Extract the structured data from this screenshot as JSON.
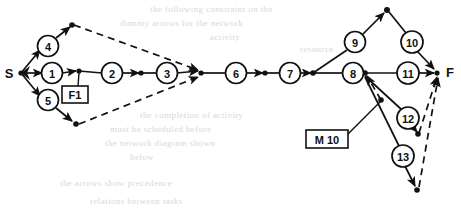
{
  "diagram": {
    "type": "activity-on-node network",
    "stroke_color": "#111111",
    "background_color": "#ffffff",
    "terminals": {
      "start": "S",
      "finish": "F"
    },
    "nodes": [
      {
        "id": "n1",
        "label": "1",
        "cx": 52,
        "cy": 73
      },
      {
        "id": "n2",
        "label": "2",
        "cx": 112,
        "cy": 73
      },
      {
        "id": "n3",
        "label": "3",
        "cx": 167,
        "cy": 73
      },
      {
        "id": "n4",
        "label": "4",
        "cx": 48,
        "cy": 46
      },
      {
        "id": "n5",
        "label": "5",
        "cx": 48,
        "cy": 100
      },
      {
        "id": "n6",
        "label": "6",
        "cx": 236,
        "cy": 73
      },
      {
        "id": "n7",
        "label": "7",
        "cx": 290,
        "cy": 73
      },
      {
        "id": "n8",
        "label": "8",
        "cx": 353,
        "cy": 73
      },
      {
        "id": "n9",
        "label": "9",
        "cx": 355,
        "cy": 42
      },
      {
        "id": "n10",
        "label": "10",
        "cx": 412,
        "cy": 42
      },
      {
        "id": "n11",
        "label": "11",
        "cx": 408,
        "cy": 73
      },
      {
        "id": "n12",
        "label": "12",
        "cx": 408,
        "cy": 118
      },
      {
        "id": "n13",
        "label": "13",
        "cx": 403,
        "cy": 156
      }
    ],
    "junction_points": [
      {
        "id": "j-start",
        "cx": 21,
        "cy": 73
      },
      {
        "id": "j-f1",
        "cx": 79,
        "cy": 70
      },
      {
        "id": "j-after2",
        "cx": 141,
        "cy": 73
      },
      {
        "id": "j-top",
        "cx": 72,
        "cy": 25
      },
      {
        "id": "j-bottom",
        "cx": 76,
        "cy": 124
      },
      {
        "id": "j-merge",
        "cx": 201,
        "cy": 73
      },
      {
        "id": "j-after6",
        "cx": 265,
        "cy": 73
      },
      {
        "id": "j-before8",
        "cx": 313,
        "cy": 73
      },
      {
        "id": "j-after8",
        "cx": 365,
        "cy": 73
      },
      {
        "id": "j-apex",
        "cx": 387,
        "cy": 10
      },
      {
        "id": "j-m10",
        "cx": 381,
        "cy": 100
      },
      {
        "id": "j-12end",
        "cx": 418,
        "cy": 134
      },
      {
        "id": "j-finish",
        "cx": 437,
        "cy": 73
      },
      {
        "id": "j-bot-end",
        "cx": 417,
        "cy": 190
      }
    ],
    "boxes": [
      {
        "id": "box-f1",
        "label": "F1",
        "x": 62,
        "y": 86,
        "w": 26,
        "h": 17
      },
      {
        "id": "box-m10",
        "label": "M 10",
        "x": 306,
        "y": 130,
        "w": 42,
        "h": 18
      }
    ],
    "edges": [
      {
        "from": "S",
        "to": "4",
        "style": "solid"
      },
      {
        "from": "S",
        "to": "1",
        "style": "solid"
      },
      {
        "from": "S",
        "to": "5",
        "style": "solid"
      },
      {
        "from": "4",
        "to": "j-top",
        "style": "solid"
      },
      {
        "from": "j-top",
        "to": "j-merge",
        "style": "dashed"
      },
      {
        "from": "1",
        "to": "j-f1",
        "style": "solid"
      },
      {
        "from": "j-f1",
        "to": "2",
        "style": "solid"
      },
      {
        "from": "2",
        "to": "j-after2",
        "style": "solid"
      },
      {
        "from": "j-after2",
        "to": "3",
        "style": "solid"
      },
      {
        "from": "3",
        "to": "j-merge",
        "style": "solid"
      },
      {
        "from": "5",
        "to": "j-bottom",
        "style": "solid"
      },
      {
        "from": "j-bottom",
        "to": "j-merge",
        "style": "dashed"
      },
      {
        "from": "j-merge",
        "to": "6",
        "style": "solid"
      },
      {
        "from": "6",
        "to": "j-after6",
        "style": "solid"
      },
      {
        "from": "j-after6",
        "to": "7",
        "style": "solid"
      },
      {
        "from": "7",
        "to": "j-before8",
        "style": "solid"
      },
      {
        "from": "j-before8",
        "to": "8",
        "style": "solid"
      },
      {
        "from": "j-before8",
        "to": "9",
        "style": "solid"
      },
      {
        "from": "9",
        "to": "j-apex",
        "style": "solid"
      },
      {
        "from": "j-apex",
        "to": "10",
        "style": "solid"
      },
      {
        "from": "10",
        "to": "F",
        "style": "solid"
      },
      {
        "from": "8",
        "to": "j-after8",
        "style": "solid"
      },
      {
        "from": "j-after8",
        "to": "11",
        "style": "solid"
      },
      {
        "from": "11",
        "to": "F",
        "style": "solid"
      },
      {
        "from": "j-after8",
        "to": "12",
        "style": "solid"
      },
      {
        "from": "12",
        "to": "j-12end",
        "style": "solid"
      },
      {
        "from": "j-12end",
        "to": "F",
        "style": "dashed"
      },
      {
        "from": "j-after8",
        "to": "13",
        "style": "solid"
      },
      {
        "from": "13",
        "to": "j-bot-end",
        "style": "solid"
      },
      {
        "from": "j-bot-end",
        "to": "F",
        "style": "dashed"
      },
      {
        "from": "j-m10",
        "to": "j-after8",
        "style": "dashed"
      },
      {
        "from": "box-m10",
        "to": "j-m10",
        "style": "leader"
      },
      {
        "from": "box-f1",
        "to": "j-f1",
        "style": "leader"
      }
    ]
  },
  "background_text": {
    "lines": [
      {
        "text": "the following constraint on the",
        "x": 150,
        "y": 4
      },
      {
        "text": "dummy arrows for the network",
        "x": 120,
        "y": 18
      },
      {
        "text": "activity",
        "x": 210,
        "y": 32
      },
      {
        "text": "resource",
        "x": 300,
        "y": 44
      },
      {
        "text": "the completion of activity",
        "x": 140,
        "y": 110
      },
      {
        "text": "must be scheduled before",
        "x": 110,
        "y": 124
      },
      {
        "text": "the network diagram shown",
        "x": 105,
        "y": 138
      },
      {
        "text": "below",
        "x": 130,
        "y": 152
      },
      {
        "text": "the arrows show precedence",
        "x": 60,
        "y": 178
      },
      {
        "text": "relations between tasks",
        "x": 90,
        "y": 196
      }
    ]
  }
}
